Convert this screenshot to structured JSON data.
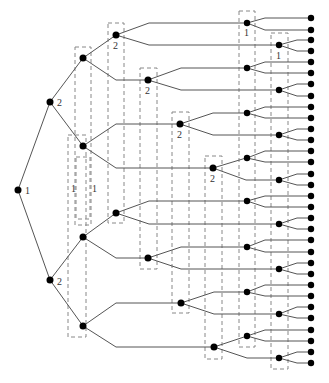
{
  "diagram": {
    "type": "binary-tree",
    "labels": [
      {
        "id": "root_label",
        "text": "1",
        "x": 25,
        "y": 194
      },
      {
        "id": "l1_top_label",
        "text": "2",
        "x": 57,
        "y": 106
      },
      {
        "id": "l1_bot_label",
        "text": "2",
        "x": 57,
        "y": 285
      },
      {
        "id": "n116_35_label",
        "text": "2",
        "x": 113,
        "y": 49
      },
      {
        "id": "n148_80_label",
        "text": "2",
        "x": 145,
        "y": 94
      },
      {
        "id": "n180_124_label",
        "text": "2",
        "x": 177,
        "y": 138
      },
      {
        "id": "n213_168_label",
        "text": "2",
        "x": 210,
        "y": 182
      },
      {
        "id": "n247_23_label",
        "text": "1",
        "x": 244,
        "y": 36
      },
      {
        "id": "n279_45_label",
        "text": "1",
        "x": 276,
        "y": 59
      },
      {
        "id": "col_label_a",
        "text": "1",
        "x": 71,
        "y": 192
      },
      {
        "id": "col_label_b",
        "text": "1",
        "x": 92,
        "y": 192
      }
    ],
    "nodes": [
      {
        "id": "root",
        "x": 18,
        "y": 190
      },
      {
        "id": "a",
        "x": 50,
        "y": 102
      },
      {
        "id": "b",
        "x": 50,
        "y": 280
      },
      {
        "id": "aa",
        "x": 83,
        "y": 58
      },
      {
        "id": "ab",
        "x": 83,
        "y": 146
      },
      {
        "id": "ba",
        "x": 83,
        "y": 237
      },
      {
        "id": "bb",
        "x": 83,
        "y": 326
      },
      {
        "id": "aaa",
        "x": 116,
        "y": 35
      },
      {
        "id": "aab",
        "x": 148,
        "y": 80
      },
      {
        "id": "aba",
        "x": 180,
        "y": 124
      },
      {
        "id": "abb",
        "x": 213,
        "y": 168
      },
      {
        "id": "baa",
        "x": 116,
        "y": 213
      },
      {
        "id": "bab",
        "x": 148,
        "y": 258
      },
      {
        "id": "bba",
        "x": 181,
        "y": 303
      },
      {
        "id": "bbb",
        "x": 214,
        "y": 347
      }
    ],
    "leaf_x": 311,
    "leaf_ys": [
      18,
      30,
      40,
      51,
      62,
      73,
      84,
      96,
      107,
      118,
      129,
      140,
      151,
      162,
      174,
      185,
      196,
      207,
      218,
      229,
      240,
      252,
      263,
      274,
      285,
      296,
      307,
      318,
      330,
      341,
      352,
      363
    ],
    "level4_nodes": [
      {
        "x": 247,
        "y": 23,
        "parent": "aaa"
      },
      {
        "x": 279,
        "y": 45,
        "parent": "aaa"
      },
      {
        "x": 247,
        "y": 68,
        "parent": "aab"
      },
      {
        "x": 279,
        "y": 90,
        "parent": "aab"
      },
      {
        "x": 247,
        "y": 113,
        "parent": "aba"
      },
      {
        "x": 279,
        "y": 135,
        "parent": "aba"
      },
      {
        "x": 247,
        "y": 158,
        "parent": "abb"
      },
      {
        "x": 279,
        "y": 180,
        "parent": "abb"
      },
      {
        "x": 247,
        "y": 201,
        "parent": "baa"
      },
      {
        "x": 279,
        "y": 224,
        "parent": "baa"
      },
      {
        "x": 247,
        "y": 247,
        "parent": "bab"
      },
      {
        "x": 279,
        "y": 269,
        "parent": "bab"
      },
      {
        "x": 247,
        "y": 292,
        "parent": "bba"
      },
      {
        "x": 279,
        "y": 314,
        "parent": "bba"
      },
      {
        "x": 247,
        "y": 336,
        "parent": "bbb"
      },
      {
        "x": 279,
        "y": 358,
        "parent": "bbb"
      }
    ],
    "dashed_boxes": [
      {
        "x": 75,
        "y": 47,
        "w": 16,
        "h": 178
      },
      {
        "x": 108,
        "y": 23,
        "w": 16,
        "h": 200
      },
      {
        "x": 140,
        "y": 68,
        "w": 17,
        "h": 201
      },
      {
        "x": 172,
        "y": 112,
        "w": 17,
        "h": 201
      },
      {
        "x": 205,
        "y": 156,
        "w": 17,
        "h": 203
      },
      {
        "x": 239,
        "y": 11,
        "w": 16,
        "h": 336
      },
      {
        "x": 271,
        "y": 33,
        "w": 17,
        "h": 336
      },
      {
        "x": 68,
        "y": 135,
        "w": 18,
        "h": 202
      },
      {
        "x": 76,
        "y": 157,
        "w": 14,
        "h": 62
      }
    ]
  }
}
